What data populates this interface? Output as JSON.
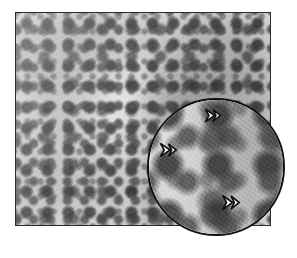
{
  "figure": {
    "domain": "micrograph",
    "modality": "brightfield light microscopy, grayscale",
    "background_color": "#ffffff"
  },
  "main_panel": {
    "name": "main-micrograph",
    "frame_color": "#2b2b2b",
    "frame_width_px": 1,
    "x": 15,
    "y": 12,
    "width": 256,
    "height": 214,
    "tissue": {
      "base_tone": "#ededed",
      "nuclei_tone": "#3e3e3e",
      "midtone": "#8a8a8a",
      "highlight": "#fafafa",
      "nucleus_spacing_px": 21,
      "illumination": "brighter lower-left, denser upper-right"
    }
  },
  "inset": {
    "name": "magnified-inset",
    "shape": "circle",
    "x": 147,
    "y": 98,
    "diameter": 138,
    "border_color": "#111111",
    "border_width_px": 2,
    "magnification_factor": 2.4,
    "source_region": "lower-right of main panel",
    "overhangs_frame_corner": true
  },
  "arrowheads": [
    {
      "name": "arrowhead-marker-1",
      "x": 204,
      "y": 108,
      "width": 18,
      "height": 15,
      "direction": "right",
      "fill": "#ffffff",
      "stroke": "#111111"
    },
    {
      "name": "arrowhead-marker-2",
      "x": 159,
      "y": 142,
      "width": 19,
      "height": 16,
      "direction": "right",
      "fill": "#ffffff",
      "stroke": "#111111"
    },
    {
      "name": "arrowhead-marker-3",
      "x": 221,
      "y": 194,
      "width": 20,
      "height": 17,
      "direction": "right",
      "fill": "#ffffff",
      "stroke": "#111111"
    }
  ],
  "accessibility": {
    "alt_text": "Grayscale histopathology micrograph showing a dense, monotonous population of small round nuclei; a circular high-magnification inset at the lower right contains three white arrowheads indicating individual cells."
  }
}
